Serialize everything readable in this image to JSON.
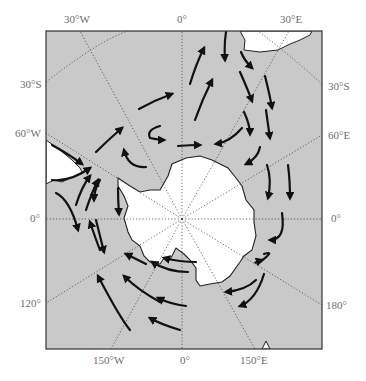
{
  "figure": {
    "type": "polar map",
    "colors": {
      "ocean": "#c9c9c9",
      "land": "#ffffff",
      "coast": "#222222",
      "arrow": "#111111",
      "grid": "#444444",
      "label": "#6e6e6e",
      "frame": "#333333"
    }
  },
  "labels": {
    "top": [
      {
        "text": "30°W",
        "x": 55,
        "y": 15
      },
      {
        "text": "0°",
        "x": 177,
        "y": 15
      },
      {
        "text": "30°E",
        "x": 281,
        "y": 15
      }
    ],
    "left": [
      {
        "text": "30°S",
        "x": 20,
        "y": 79
      },
      {
        "text": "60°W",
        "x": 15,
        "y": 128
      },
      {
        "text": "0°",
        "x": 30,
        "y": 213
      },
      {
        "text": "120°",
        "x": 20,
        "y": 298
      }
    ],
    "right": [
      {
        "text": "30°S",
        "x": 328,
        "y": 81
      },
      {
        "text": "60°E",
        "x": 328,
        "y": 130
      },
      {
        "text": "0°",
        "x": 331,
        "y": 213
      },
      {
        "text": "180°",
        "x": 326,
        "y": 300
      }
    ],
    "bottom": [
      {
        "text": "150°W",
        "x": 93,
        "y": 355
      },
      {
        "text": "0°",
        "x": 180,
        "y": 355
      },
      {
        "text": "150°E",
        "x": 240,
        "y": 355
      }
    ]
  },
  "map": {
    "frame": {
      "x": 46,
      "y": 31,
      "width": 276,
      "height": 318
    },
    "pole": {
      "x": 182,
      "y": 219
    }
  }
}
